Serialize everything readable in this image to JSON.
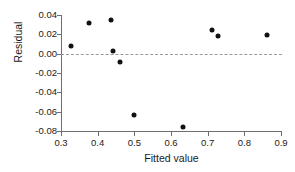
{
  "chart_data": {
    "type": "scatter",
    "title": "",
    "xlabel": "Fitted value",
    "ylabel": "Residual",
    "xlim": [
      0.3,
      0.9
    ],
    "ylim": [
      -0.08,
      0.04
    ],
    "xticks": [
      "0.3",
      "0.4",
      "0.5",
      "0.6",
      "0.7",
      "0.8",
      "0.9"
    ],
    "xtick_values": [
      0.3,
      0.4,
      0.5,
      0.6,
      0.7,
      0.8,
      0.9
    ],
    "yticks": [
      "0.04",
      "0.02",
      "0.00",
      "-0.02",
      "-0.04",
      "-0.06",
      "-0.08"
    ],
    "ytick_values": [
      0.04,
      0.02,
      0.0,
      -0.02,
      -0.04,
      -0.06,
      -0.08
    ],
    "grid": false,
    "legend": null,
    "reference_line": {
      "orientation": "horizontal",
      "y": 0.0,
      "style": "dashed",
      "color": "#9a9a9a"
    },
    "marker": {
      "shape": "circle",
      "color": "#111111",
      "size": 5
    },
    "x": [
      0.327,
      0.376,
      0.436,
      0.442,
      0.461,
      0.498,
      0.632,
      0.713,
      0.729,
      0.863
    ],
    "y": [
      0.008,
      0.032,
      0.035,
      0.003,
      -0.009,
      -0.063,
      -0.076,
      0.024,
      0.018,
      0.019
    ],
    "points": [
      {
        "x": 0.327,
        "y": 0.008
      },
      {
        "x": 0.376,
        "y": 0.032
      },
      {
        "x": 0.436,
        "y": 0.035
      },
      {
        "x": 0.442,
        "y": 0.003
      },
      {
        "x": 0.461,
        "y": -0.009
      },
      {
        "x": 0.498,
        "y": -0.063
      },
      {
        "x": 0.632,
        "y": -0.076
      },
      {
        "x": 0.713,
        "y": 0.024
      },
      {
        "x": 0.729,
        "y": 0.018
      },
      {
        "x": 0.863,
        "y": 0.019
      }
    ]
  },
  "axes": {
    "x_label": "Fitted value",
    "y_label": "Residual"
  }
}
